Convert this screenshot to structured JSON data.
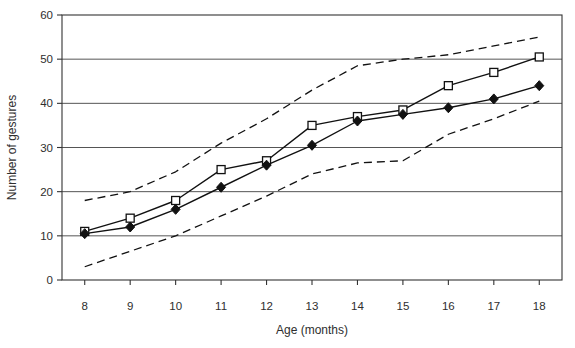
{
  "chart_data": {
    "type": "line",
    "x": [
      8,
      9,
      10,
      11,
      12,
      13,
      14,
      15,
      16,
      17,
      18
    ],
    "xlabel": "Age (months)",
    "ylabel": "Number of gestures",
    "ylim": [
      0,
      60
    ],
    "yticks": [
      0,
      10,
      20,
      30,
      40,
      50,
      60
    ],
    "grid": "horizontal",
    "legend": "none",
    "series": [
      {
        "name": "open-square-line",
        "marker": "open-square",
        "line": "solid",
        "color": "#111111",
        "values": [
          11,
          14,
          18,
          25,
          27,
          35,
          37,
          38.5,
          44,
          47,
          50.5
        ]
      },
      {
        "name": "filled-diamond-line",
        "marker": "filled-diamond",
        "line": "solid",
        "color": "#111111",
        "values": [
          10.5,
          12,
          16,
          21,
          26,
          30.5,
          36,
          37.5,
          39,
          41,
          44
        ]
      },
      {
        "name": "upper-dashed-band",
        "marker": "none",
        "line": "dashed",
        "color": "#111111",
        "values": [
          18,
          20,
          24.5,
          31,
          36.5,
          43,
          48.5,
          50,
          51,
          53,
          55
        ]
      },
      {
        "name": "lower-dashed-band",
        "marker": "none",
        "line": "dashed",
        "color": "#111111",
        "values": [
          3,
          6.5,
          10,
          14.5,
          19,
          24,
          26.5,
          27,
          33,
          36.5,
          40.5
        ]
      }
    ]
  }
}
